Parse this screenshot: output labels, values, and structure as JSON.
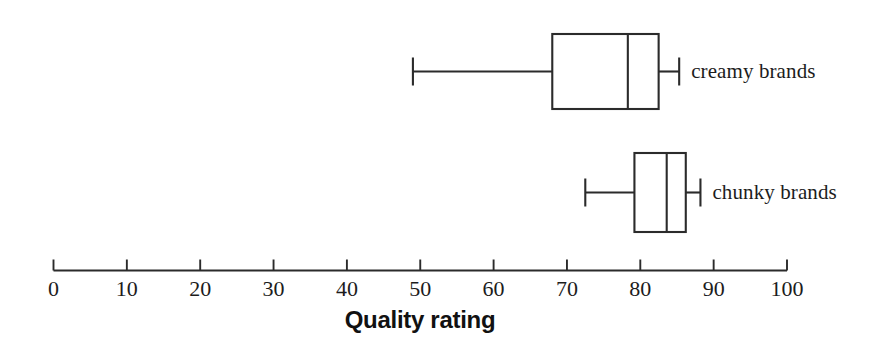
{
  "chart_data": {
    "type": "box",
    "orientation": "horizontal",
    "title": "",
    "subtitle": "",
    "xlabel": "Quality rating",
    "ylabel": "",
    "xlim": [
      0,
      100
    ],
    "xticks": [
      0,
      10,
      20,
      30,
      40,
      50,
      60,
      70,
      80,
      90,
      100
    ],
    "xtick_labels": [
      "0",
      "10",
      "20",
      "30",
      "40",
      "50",
      "60",
      "70",
      "80",
      "90",
      "100"
    ],
    "grid": false,
    "legend": "none",
    "annotations": [],
    "line_color": "#2b2b2b",
    "box_fill": "#ffffff",
    "categories": [
      "creamy brands",
      "chunky brands"
    ],
    "boxes": [
      {
        "label": "creamy brands",
        "min": 49.0,
        "q1": 68.0,
        "median": 78.3,
        "q3": 82.5,
        "max": 85.3,
        "outliers": []
      },
      {
        "label": "chunky brands",
        "min": 72.5,
        "q1": 79.2,
        "median": 83.6,
        "q3": 86.2,
        "max": 88.2,
        "outliers": []
      }
    ]
  },
  "axis": {
    "title": "Quality rating",
    "tick_labels": [
      "0",
      "10",
      "20",
      "30",
      "40",
      "50",
      "60",
      "70",
      "80",
      "90",
      "100"
    ]
  },
  "series_labels": {
    "creamy": "creamy brands",
    "chunky": "chunky brands"
  }
}
